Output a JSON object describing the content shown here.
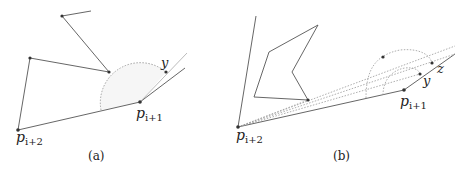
{
  "panels": [
    {
      "caption": "(a)",
      "labels": {
        "p_i2_base": "p",
        "p_i2_sub": "i+2",
        "p_i1_base": "p",
        "p_i1_sub": "i+1",
        "y": "y"
      }
    },
    {
      "caption": "(b)",
      "labels": {
        "p_i2_base": "p",
        "p_i2_sub": "i+2",
        "p_i1_base": "p",
        "p_i1_sub": "i+1",
        "y": "y",
        "z": "z"
      }
    }
  ],
  "colors": {
    "line": "#555555",
    "dotted": "#999999",
    "point": "#333333",
    "fill": "#f4f4f4"
  }
}
